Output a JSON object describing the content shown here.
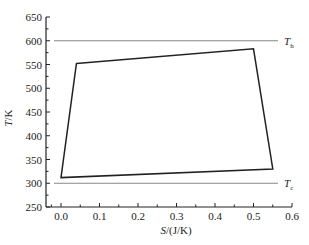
{
  "chart_data": {
    "type": "line",
    "title": "",
    "xlabel": "S/(J/K)",
    "xlabel_italic_part": "S",
    "xlabel_rest": "/(J/K)",
    "ylabel": "T/K",
    "ylabel_italic_part": "T",
    "ylabel_rest": "/K",
    "xlim": [
      -0.03,
      0.6
    ],
    "ylim": [
      250,
      650
    ],
    "xticks": [
      0.0,
      0.1,
      0.2,
      0.3,
      0.4,
      0.5,
      0.6
    ],
    "xtick_labels": [
      "0.0",
      "0.1",
      "0.2",
      "0.3",
      "0.4",
      "0.5",
      "0.6"
    ],
    "yticks": [
      250,
      300,
      350,
      400,
      450,
      500,
      550,
      600,
      650
    ],
    "ytick_labels": [
      "250",
      "300",
      "350",
      "400",
      "450",
      "500",
      "550",
      "600",
      "650"
    ],
    "grid": false,
    "series": [
      {
        "name": "cycle",
        "closed": true,
        "color": "#222222",
        "points": [
          {
            "S": 0.04,
            "T": 552
          },
          {
            "S": 0.5,
            "T": 583
          },
          {
            "S": 0.55,
            "T": 330
          },
          {
            "S": 0.0,
            "T": 312
          }
        ]
      }
    ],
    "reference_lines": [
      {
        "name": "Th",
        "label_main": "T",
        "label_sub": "h",
        "T": 600,
        "color": "#888888"
      },
      {
        "name": "Tc",
        "label_main": "T",
        "label_sub": "c",
        "T": 300,
        "color": "#888888"
      }
    ]
  }
}
